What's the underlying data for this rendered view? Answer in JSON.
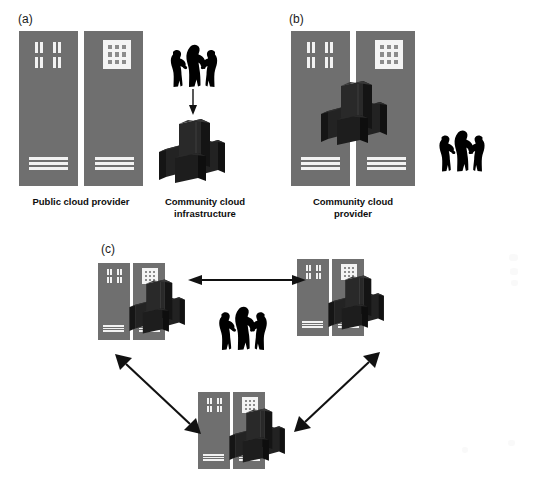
{
  "figure": {
    "background_color": "#ffffff",
    "building_color": "#6f6f6f",
    "window_color": "#f2f2f2",
    "server_color": "#1a1a1a",
    "people_color": "#000000",
    "arrow_color": "#111111"
  },
  "panels": [
    {
      "letter": "(a)",
      "caption_left": "Public cloud provider",
      "caption_right": "Community cloud\ninfrastructure",
      "buildings": 2,
      "people_count": 3,
      "arrow": "down-arrow",
      "description": "Two public cloud provider buildings beside a separate community cloud infrastructure with users pointing down to it"
    },
    {
      "letter": "(b)",
      "caption": "Community cloud\nprovider",
      "buildings": 2,
      "people_count": 3,
      "description": "Community cloud provider buildings with servers overlaid, users to the right"
    },
    {
      "letter": "(c)",
      "caption": "",
      "nodes": 3,
      "people_count": 3,
      "arrows": [
        "double-arrow-horizontal",
        "double-arrow-diagonal-left",
        "double-arrow-diagonal-right"
      ],
      "description": "Three peer community cloud nodes in a triangle connected by bidirectional arrows with users at the centre"
    }
  ],
  "labels": {
    "panel_a_letter": "(a)",
    "panel_b_letter": "(b)",
    "panel_c_letter": "(c)",
    "public_cloud_provider": "Public cloud provider",
    "community_cloud_infrastructure": "Community cloud\ninfrastructure",
    "community_cloud_provider": "Community cloud\nprovider"
  }
}
